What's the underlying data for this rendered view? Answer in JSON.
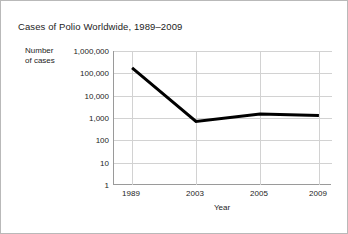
{
  "chart_data": {
    "type": "line",
    "title": "Cases of Polio Worldwide, 1989–2009",
    "xlabel": "Year",
    "ylabel": "Number of cases",
    "ylabel_lines": [
      "Number",
      "of cases"
    ],
    "x": [
      1989,
      2003,
      2005,
      2009
    ],
    "categories": [
      "1989",
      "2003",
      "2005",
      "2009"
    ],
    "values": [
      175000,
      700,
      1500,
      1300
    ],
    "series": [
      {
        "name": "Cases of polio",
        "values": [
          175000,
          700,
          1500,
          1300
        ]
      }
    ],
    "yscale": "log",
    "ylim": [
      1,
      1000000
    ],
    "ytick_values": [
      1000000,
      100000,
      10000,
      1000,
      100,
      10,
      1
    ],
    "ytick_labels": [
      "1,000,000",
      "100,000",
      "10,000",
      "1,000",
      "100",
      "10",
      "1"
    ],
    "xtick_labels": [
      "1989",
      "2003",
      "2005",
      "2009"
    ],
    "xtick_positions_pct": [
      8.3,
      37.6,
      67.0,
      94.0
    ],
    "grid": true,
    "legend": "none",
    "line_color": "#000000",
    "line_width_px": 3,
    "grid_color": "#d2d2d2",
    "axis_color": "#9a9a9a",
    "border_color": "#b9b9b9",
    "background": "#ffffff",
    "text_color": "#1c1c1c"
  }
}
